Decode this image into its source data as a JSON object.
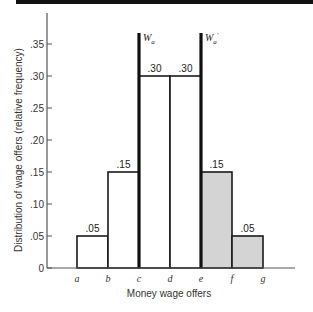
{
  "chart_data": {
    "type": "bar",
    "title": "",
    "xlabel": "Money wage offers",
    "ylabel": "Distribution of wage offers (relative frequency)",
    "categories": [
      "a–b",
      "b–c",
      "c–d",
      "d–e",
      "e–f",
      "f–g"
    ],
    "x_ticks": [
      "a",
      "b",
      "c",
      "d",
      "e",
      "f",
      "g"
    ],
    "values": [
      0.05,
      0.15,
      0.3,
      0.3,
      0.15,
      0.05
    ],
    "value_labels": [
      ".05",
      ".15",
      ".30",
      ".30",
      ".15",
      ".05"
    ],
    "shaded": [
      false,
      false,
      false,
      false,
      true,
      true
    ],
    "y_ticks": [
      "0",
      ".05",
      ".10",
      ".15",
      ".20",
      ".25",
      ".30",
      ".35"
    ],
    "ylim": [
      0,
      0.38
    ],
    "grid": false,
    "annotations": [
      {
        "label": "W",
        "subscript": "a",
        "prime": false,
        "at": "c"
      },
      {
        "label": "W",
        "subscript": "a",
        "prime": true,
        "at": "e"
      }
    ],
    "colors": {
      "bar_fill": "#ffffff",
      "shaded_fill": "#d4d4d4",
      "outline": "#1a1a1a",
      "axis": "#555555"
    }
  }
}
